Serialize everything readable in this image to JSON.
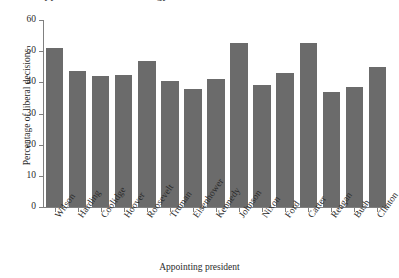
{
  "chart_data": {
    "type": "bar",
    "title": "Appointments and ideology ",
    "xlabel": "Appointing president",
    "ylabel": "Percentage of liberal decisions",
    "categories": [
      "Wilson",
      "Harding",
      "Coolidge",
      "Hoover",
      "Roosevelt",
      "Truman",
      "Eisenhower",
      "Kennedy",
      "Johnson",
      "Nixon",
      "Ford",
      "Carter",
      "Reagan",
      "Bush",
      "Clinton"
    ],
    "values": [
      51,
      43.5,
      42,
      42.5,
      47,
      40.5,
      38,
      41,
      52.5,
      39,
      43,
      52.5,
      37,
      38.5,
      45
    ],
    "ylim": [
      0,
      60
    ],
    "yticks": [
      0,
      10,
      20,
      30,
      40,
      50,
      60
    ],
    "ytick_labels": [
      "0",
      "10",
      "20",
      "30",
      "40",
      "50",
      "60"
    ],
    "grid": false,
    "legend": "none",
    "bar_color": "#6b6b6b",
    "axis_color": "#808080",
    "background": "#ffffff"
  }
}
